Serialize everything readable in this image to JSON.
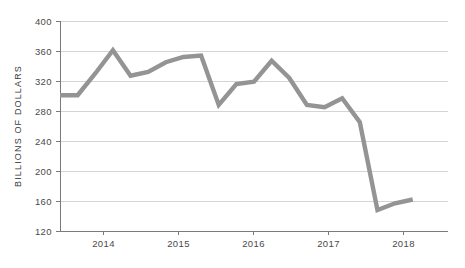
{
  "chart_data": {
    "type": "line",
    "title": "",
    "subtitle": "",
    "xlabel": "",
    "ylabel": "BILLIONS OF DOLLARS",
    "ylim": [
      120,
      400
    ],
    "ytick_values": [
      120,
      160,
      200,
      240,
      280,
      320,
      360,
      400
    ],
    "ytick_labels": [
      "120",
      "160",
      "200",
      "240",
      "280",
      "320",
      "360",
      "400"
    ],
    "xtick_labels": [
      "2014",
      "2015",
      "2016",
      "2017",
      "2018"
    ],
    "xtick_values": [
      2014,
      2015,
      2016,
      2017,
      2018
    ],
    "xlim": [
      2013.5,
      2019.0
    ],
    "grid": "horizontal",
    "legend": "none",
    "series": [
      {
        "name": "Billions of dollars",
        "color": "#949494",
        "x": [
          2013.5,
          2013.75,
          2014.0,
          2014.25,
          2014.5,
          2014.75,
          2015.0,
          2015.25,
          2015.5,
          2015.75,
          2016.0,
          2016.25,
          2016.5,
          2016.75,
          2017.0,
          2017.25,
          2017.5,
          2017.75,
          2018.0,
          2018.25,
          2018.5
        ],
        "values": [
          301,
          301,
          330,
          361,
          327,
          332,
          345,
          352,
          354,
          288,
          316,
          319,
          347,
          324,
          288,
          285,
          297,
          265,
          148,
          157,
          162
        ]
      }
    ],
    "annotations": [],
    "line_color": "#949494",
    "gridline_color": "#cfcfcf",
    "axis_color": "#7a7a7a",
    "background_color": "#ffffff",
    "text_color": "#4a4a4a"
  }
}
